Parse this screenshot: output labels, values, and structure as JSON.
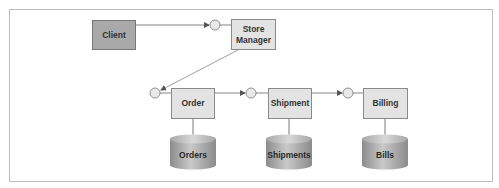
{
  "diagram": {
    "type": "component-architecture",
    "nodes": {
      "client": {
        "label": "Client",
        "shape": "box",
        "fill": "#a9a9a9"
      },
      "store_manager": {
        "label_line1": "Store",
        "label_line2": "Manager",
        "shape": "box",
        "fill": "#e3e3e3"
      },
      "order": {
        "label": "Order",
        "shape": "box",
        "fill": "#e3e3e3"
      },
      "shipment": {
        "label": "Shipment",
        "shape": "box",
        "fill": "#e3e3e3"
      },
      "billing": {
        "label": "Billing",
        "shape": "box",
        "fill": "#e3e3e3"
      }
    },
    "databases": {
      "orders": {
        "label": "Orders"
      },
      "shipments": {
        "label": "Shipments"
      },
      "bills": {
        "label": "Bills"
      }
    },
    "edges": [
      {
        "from": "Client",
        "to": "Store Manager",
        "style": "arrow-to-interface"
      },
      {
        "from": "Store Manager",
        "to": "Order",
        "style": "arrow-to-interface"
      },
      {
        "from": "Order",
        "to": "Shipment",
        "style": "arrow-to-interface"
      },
      {
        "from": "Shipment",
        "to": "Billing",
        "style": "arrow-to-interface"
      },
      {
        "from": "Order",
        "to": "Orders",
        "style": "arrow"
      },
      {
        "from": "Shipment",
        "to": "Shipments",
        "style": "arrow"
      },
      {
        "from": "Billing",
        "to": "Bills",
        "style": "arrow"
      }
    ],
    "colors": {
      "frame": "#bdbdbd",
      "box_border": "#8a8a8a",
      "line": "#666666",
      "db_dark": "#8e8e8e",
      "db_light": "#c8c8c8"
    }
  }
}
